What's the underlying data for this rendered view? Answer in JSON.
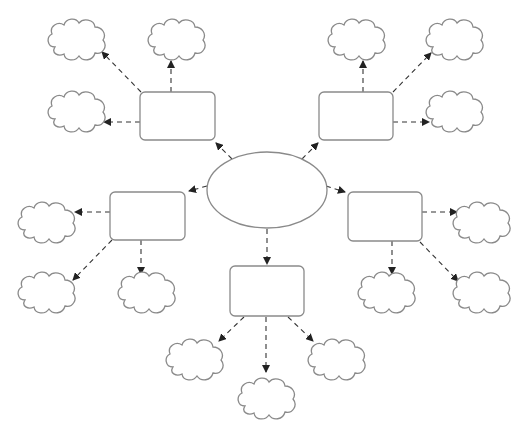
{
  "diagram": {
    "type": "mind-map-cluster",
    "title": "",
    "stroke_color": "#8a8a8a",
    "arrow_color": "#333333",
    "background": "#ffffff",
    "center": {
      "id": "center",
      "shape": "ellipse",
      "cx": 267,
      "cy": 190,
      "rx": 60,
      "ry": 38,
      "label": ""
    },
    "boxes": [
      {
        "id": "box-top-left",
        "x": 140,
        "y": 92,
        "w": 75,
        "h": 48,
        "label": ""
      },
      {
        "id": "box-top-right",
        "x": 319,
        "y": 92,
        "w": 74,
        "h": 48,
        "label": ""
      },
      {
        "id": "box-left",
        "x": 110,
        "y": 192,
        "w": 75,
        "h": 48,
        "label": ""
      },
      {
        "id": "box-right",
        "x": 348,
        "y": 192,
        "w": 74,
        "h": 49,
        "label": ""
      },
      {
        "id": "box-bottom",
        "x": 230,
        "y": 266,
        "w": 74,
        "h": 50,
        "label": ""
      }
    ],
    "clouds": [
      {
        "id": "cloud-tl-1",
        "parent": "box-top-left",
        "x": 45,
        "y": 17,
        "label": ""
      },
      {
        "id": "cloud-tl-2",
        "parent": "box-top-left",
        "x": 145,
        "y": 17,
        "label": ""
      },
      {
        "id": "cloud-tl-3",
        "parent": "box-top-left",
        "x": 45,
        "y": 89,
        "label": ""
      },
      {
        "id": "cloud-tr-1",
        "parent": "box-top-right",
        "x": 325,
        "y": 17,
        "label": ""
      },
      {
        "id": "cloud-tr-2",
        "parent": "box-top-right",
        "x": 423,
        "y": 17,
        "label": ""
      },
      {
        "id": "cloud-tr-3",
        "parent": "box-top-right",
        "x": 423,
        "y": 89,
        "label": ""
      },
      {
        "id": "cloud-l-1",
        "parent": "box-left",
        "x": 15,
        "y": 200,
        "label": ""
      },
      {
        "id": "cloud-l-2",
        "parent": "box-left",
        "x": 15,
        "y": 270,
        "label": ""
      },
      {
        "id": "cloud-l-3",
        "parent": "box-left",
        "x": 115,
        "y": 270,
        "label": ""
      },
      {
        "id": "cloud-r-1",
        "parent": "box-right",
        "x": 450,
        "y": 200,
        "label": ""
      },
      {
        "id": "cloud-r-2",
        "parent": "box-right",
        "x": 355,
        "y": 270,
        "label": ""
      },
      {
        "id": "cloud-r-3",
        "parent": "box-right",
        "x": 450,
        "y": 270,
        "label": ""
      },
      {
        "id": "cloud-b-1",
        "parent": "box-bottom",
        "x": 163,
        "y": 337,
        "label": ""
      },
      {
        "id": "cloud-b-2",
        "parent": "box-bottom",
        "x": 235,
        "y": 376,
        "label": ""
      },
      {
        "id": "cloud-b-3",
        "parent": "box-bottom",
        "x": 305,
        "y": 337,
        "label": ""
      }
    ],
    "arrows": [
      {
        "from": "center",
        "to": "box-top-left",
        "x1": 232,
        "y1": 159,
        "x2": 216,
        "y2": 143
      },
      {
        "from": "center",
        "to": "box-top-right",
        "x1": 302,
        "y1": 159,
        "x2": 318,
        "y2": 143
      },
      {
        "from": "center",
        "to": "box-left",
        "x1": 207,
        "y1": 186,
        "x2": 189,
        "y2": 191
      },
      {
        "from": "center",
        "to": "box-right",
        "x1": 326,
        "y1": 186,
        "x2": 345,
        "y2": 192
      },
      {
        "from": "center",
        "to": "box-bottom",
        "x1": 267,
        "y1": 229,
        "x2": 267,
        "y2": 264
      },
      {
        "from": "box-top-left",
        "to": "cloud-tl-1",
        "x1": 141,
        "y1": 92,
        "x2": 102,
        "y2": 52
      },
      {
        "from": "box-top-left",
        "to": "cloud-tl-2",
        "x1": 171,
        "y1": 92,
        "x2": 171,
        "y2": 61
      },
      {
        "from": "box-top-left",
        "to": "cloud-tl-3",
        "x1": 140,
        "y1": 122,
        "x2": 104,
        "y2": 122
      },
      {
        "from": "box-top-right",
        "to": "cloud-tr-1",
        "x1": 363,
        "y1": 92,
        "x2": 363,
        "y2": 61
      },
      {
        "from": "box-top-right",
        "to": "cloud-tr-2",
        "x1": 393,
        "y1": 92,
        "x2": 431,
        "y2": 53
      },
      {
        "from": "box-top-right",
        "to": "cloud-tr-3",
        "x1": 393,
        "y1": 122,
        "x2": 429,
        "y2": 122
      },
      {
        "from": "box-left",
        "to": "cloud-l-1",
        "x1": 110,
        "y1": 212,
        "x2": 75,
        "y2": 212
      },
      {
        "from": "box-left",
        "to": "cloud-l-2",
        "x1": 112,
        "y1": 240,
        "x2": 73,
        "y2": 280
      },
      {
        "from": "box-left",
        "to": "cloud-l-3",
        "x1": 141,
        "y1": 240,
        "x2": 141,
        "y2": 274
      },
      {
        "from": "box-right",
        "to": "cloud-r-1",
        "x1": 422,
        "y1": 212,
        "x2": 457,
        "y2": 212
      },
      {
        "from": "box-right",
        "to": "cloud-r-2",
        "x1": 392,
        "y1": 241,
        "x2": 392,
        "y2": 274
      },
      {
        "from": "box-right",
        "to": "cloud-r-3",
        "x1": 420,
        "y1": 242,
        "x2": 458,
        "y2": 281
      },
      {
        "from": "box-bottom",
        "to": "cloud-b-1",
        "x1": 244,
        "y1": 317,
        "x2": 219,
        "y2": 341
      },
      {
        "from": "box-bottom",
        "to": "cloud-b-2",
        "x1": 266,
        "y1": 317,
        "x2": 266,
        "y2": 372
      },
      {
        "from": "box-bottom",
        "to": "cloud-b-3",
        "x1": 288,
        "y1": 317,
        "x2": 313,
        "y2": 341
      }
    ]
  }
}
